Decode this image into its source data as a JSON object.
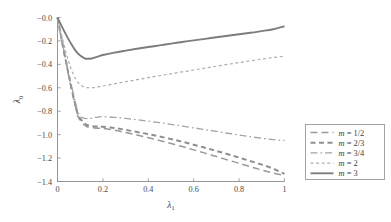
{
  "chart_data": {
    "type": "line",
    "title": "",
    "xlabel": "λ₁",
    "ylabel": "λ₀",
    "xlabel_base": "λ",
    "xlabel_sub": "1",
    "ylabel_base": "λ",
    "ylabel_sub": "0",
    "xlim": [
      0,
      1
    ],
    "ylim": [
      -1.4,
      0.0
    ],
    "grid": false,
    "legend_position": "right-outside",
    "xticks": [
      0,
      0.2,
      0.4,
      0.6,
      0.8,
      1
    ],
    "xtick_labels": [
      "0",
      "0.2",
      "0.4",
      "0.6",
      "0.8",
      "1"
    ],
    "yticks": [
      0.0,
      -0.2,
      -0.4,
      -0.6,
      -0.8,
      -1.0,
      -1.2,
      -1.4
    ],
    "ytick_labels": [
      "−0.0",
      "−0.2",
      "−0.4",
      "−0.6",
      "−0.8",
      "−1.0",
      "−1.2",
      "−1.4"
    ],
    "series": [
      {
        "name": "m = 1/2",
        "label_var": "m",
        "label_eq": " = ",
        "label_val": "1/2",
        "color": "#999999",
        "dash": "7,4",
        "width": 1.5,
        "x": [
          0,
          0.02,
          0.04,
          0.06,
          0.08,
          0.09,
          0.1,
          0.11,
          0.12,
          0.13,
          0.15,
          0.18,
          0.2,
          0.25,
          0.3,
          0.35,
          0.4,
          0.45,
          0.5,
          0.55,
          0.6,
          0.65,
          0.7,
          0.75,
          0.8,
          0.85,
          0.9,
          0.95,
          1.0
        ],
        "y": [
          0.0,
          -0.21,
          -0.41,
          -0.6,
          -0.77,
          -0.845,
          -0.875,
          -0.9,
          -0.92,
          -0.932,
          -0.94,
          -0.945,
          -0.947,
          -0.962,
          -0.982,
          -1.003,
          -1.026,
          -1.05,
          -1.076,
          -1.102,
          -1.13,
          -1.158,
          -1.187,
          -1.216,
          -1.245,
          -1.274,
          -1.302,
          -1.328,
          -1.35
        ]
      },
      {
        "name": "m = 2/3",
        "label_var": "m",
        "label_eq": " = ",
        "label_val": "2/3",
        "color": "#8e8e8e",
        "dash": "5,3.5",
        "width": 2.0,
        "x": [
          0,
          0.02,
          0.04,
          0.06,
          0.08,
          0.09,
          0.1,
          0.11,
          0.12,
          0.13,
          0.15,
          0.18,
          0.2,
          0.25,
          0.3,
          0.35,
          0.4,
          0.45,
          0.5,
          0.55,
          0.6,
          0.65,
          0.7,
          0.75,
          0.8,
          0.85,
          0.9,
          0.95,
          1.0
        ],
        "y": [
          0.0,
          -0.205,
          -0.4,
          -0.585,
          -0.755,
          -0.83,
          -0.862,
          -0.885,
          -0.905,
          -0.918,
          -0.928,
          -0.932,
          -0.933,
          -0.944,
          -0.959,
          -0.977,
          -0.996,
          -1.016,
          -1.038,
          -1.061,
          -1.086,
          -1.112,
          -1.139,
          -1.167,
          -1.196,
          -1.226,
          -1.256,
          -1.29,
          -1.335
        ]
      },
      {
        "name": "m = 3/4",
        "label_var": "m",
        "label_eq": " = ",
        "label_val": "3/4",
        "color": "#a3a3a3",
        "dash": "7,3,1.6,3",
        "width": 1.3,
        "x": [
          0,
          0.02,
          0.04,
          0.06,
          0.08,
          0.09,
          0.1,
          0.11,
          0.12,
          0.14,
          0.16,
          0.18,
          0.2,
          0.25,
          0.3,
          0.35,
          0.4,
          0.45,
          0.5,
          0.55,
          0.6,
          0.65,
          0.7,
          0.75,
          0.8,
          0.85,
          0.9,
          0.95,
          1.0
        ],
        "y": [
          0.0,
          -0.2,
          -0.39,
          -0.57,
          -0.735,
          -0.805,
          -0.838,
          -0.855,
          -0.862,
          -0.862,
          -0.855,
          -0.85,
          -0.847,
          -0.852,
          -0.862,
          -0.873,
          -0.885,
          -0.898,
          -0.912,
          -0.927,
          -0.942,
          -0.957,
          -0.972,
          -0.988,
          -1.003,
          -1.018,
          -1.031,
          -1.042,
          -1.05
        ]
      },
      {
        "name": "m = 2",
        "label_var": "m",
        "label_eq": " = ",
        "label_val": "2",
        "color": "#adadad",
        "dash": "3,2.6",
        "width": 1.2,
        "x": [
          0,
          0.02,
          0.04,
          0.06,
          0.08,
          0.1,
          0.12,
          0.14,
          0.16,
          0.18,
          0.2,
          0.25,
          0.3,
          0.35,
          0.4,
          0.45,
          0.5,
          0.55,
          0.6,
          0.65,
          0.7,
          0.75,
          0.8,
          0.85,
          0.9,
          0.95,
          1.0
        ],
        "y": [
          0.0,
          -0.165,
          -0.315,
          -0.44,
          -0.525,
          -0.573,
          -0.595,
          -0.6,
          -0.598,
          -0.592,
          -0.585,
          -0.566,
          -0.548,
          -0.531,
          -0.514,
          -0.497,
          -0.48,
          -0.464,
          -0.448,
          -0.432,
          -0.416,
          -0.4,
          -0.385,
          -0.37,
          -0.355,
          -0.342,
          -0.33
        ]
      },
      {
        "name": "m = 3",
        "label_var": "m",
        "label_eq": " = ",
        "label_val": "3",
        "color": "#7d7d7d",
        "dash": "none",
        "width": 1.9,
        "x": [
          0,
          0.02,
          0.04,
          0.06,
          0.08,
          0.1,
          0.12,
          0.13,
          0.15,
          0.17,
          0.19,
          0.2,
          0.25,
          0.3,
          0.35,
          0.4,
          0.45,
          0.5,
          0.55,
          0.6,
          0.65,
          0.7,
          0.75,
          0.8,
          0.85,
          0.9,
          0.95,
          1.0
        ],
        "y": [
          0.0,
          -0.08,
          -0.155,
          -0.225,
          -0.285,
          -0.325,
          -0.348,
          -0.352,
          -0.35,
          -0.338,
          -0.326,
          -0.32,
          -0.3,
          -0.283,
          -0.267,
          -0.252,
          -0.238,
          -0.223,
          -0.209,
          -0.195,
          -0.182,
          -0.169,
          -0.156,
          -0.143,
          -0.13,
          -0.116,
          -0.1,
          -0.075
        ]
      }
    ]
  }
}
